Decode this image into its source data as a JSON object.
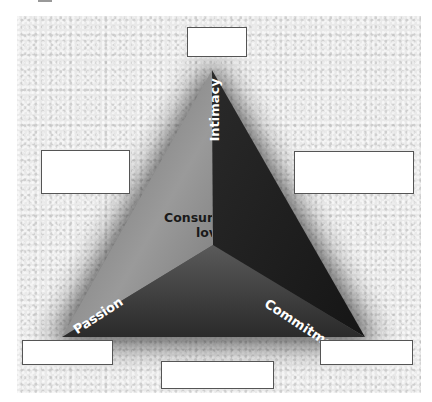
{
  "diagram": {
    "vertices": {
      "top": "Intimacy",
      "bottom_left": "Passion",
      "bottom_right": "Commitment"
    },
    "center_label_line1": "Consummate",
    "center_label_line2": "love",
    "center_label_visible_line1": "Consu",
    "center_label_visible_line2": "lo",
    "blank_boxes": [
      {
        "position": "top",
        "text": ""
      },
      {
        "position": "left",
        "text": ""
      },
      {
        "position": "right",
        "text": ""
      },
      {
        "position": "bottom-left",
        "text": ""
      },
      {
        "position": "bottom-center",
        "text": ""
      },
      {
        "position": "bottom-right",
        "text": ""
      }
    ],
    "colors": {
      "background_texture": "#e9e9e9",
      "triangle_dark": "#1c1c1c",
      "triangle_mid": "#4a4a4a",
      "triangle_light": "#8a8a8a",
      "label_text": "#ffffff",
      "box_border": "#555555"
    }
  }
}
